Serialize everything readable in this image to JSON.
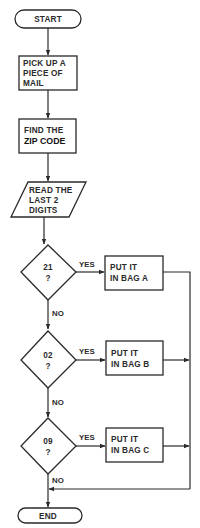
{
  "diagram": {
    "type": "flowchart",
    "nodes": {
      "start": {
        "kind": "terminal",
        "label": "START"
      },
      "pick_up": {
        "kind": "process",
        "lines": [
          "PICK UP A",
          "PIECE OF",
          "MAIL"
        ]
      },
      "find_zip": {
        "kind": "process",
        "lines": [
          "FIND THE",
          "ZIP CODE"
        ],
        "emphasis": "ZIP CODE"
      },
      "read_digits": {
        "kind": "input",
        "lines": [
          "READ THE",
          "LAST 2",
          "DIGITS"
        ]
      },
      "decision_21": {
        "kind": "decision",
        "lines": [
          "21",
          "?"
        ]
      },
      "bag_a": {
        "kind": "process",
        "lines": [
          "PUT IT",
          "IN BAG A"
        ]
      },
      "decision_02": {
        "kind": "decision",
        "lines": [
          "02",
          "?"
        ]
      },
      "bag_b": {
        "kind": "process",
        "lines": [
          "PUT IT",
          "IN BAG B"
        ]
      },
      "decision_09": {
        "kind": "decision",
        "lines": [
          "09",
          "?"
        ]
      },
      "bag_c": {
        "kind": "process",
        "lines": [
          "PUT IT",
          "IN BAG C"
        ]
      },
      "end": {
        "kind": "terminal",
        "label": "END"
      }
    },
    "edges": [
      {
        "from": "start",
        "to": "pick_up",
        "label": ""
      },
      {
        "from": "pick_up",
        "to": "find_zip",
        "label": ""
      },
      {
        "from": "find_zip",
        "to": "read_digits",
        "label": ""
      },
      {
        "from": "read_digits",
        "to": "decision_21",
        "label": ""
      },
      {
        "from": "decision_21",
        "to": "bag_a",
        "label": "YES"
      },
      {
        "from": "decision_21",
        "to": "decision_02",
        "label": "NO"
      },
      {
        "from": "decision_02",
        "to": "bag_b",
        "label": "YES"
      },
      {
        "from": "decision_02",
        "to": "decision_09",
        "label": "NO"
      },
      {
        "from": "decision_09",
        "to": "bag_c",
        "label": "YES"
      },
      {
        "from": "decision_09",
        "to": "end",
        "label": "NO"
      },
      {
        "from": "bag_a",
        "to": "end",
        "label": ""
      },
      {
        "from": "bag_b",
        "to": "end",
        "label": ""
      },
      {
        "from": "bag_c",
        "to": "end",
        "label": ""
      }
    ],
    "edge_labels": {
      "yes": "YES",
      "no": "NO"
    },
    "colors": {
      "stroke": "#2a2a2a",
      "background": "#ffffff"
    }
  }
}
